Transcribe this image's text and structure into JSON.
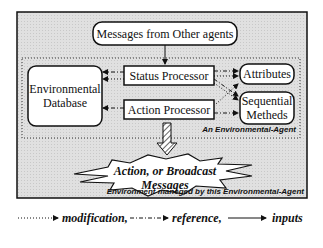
{
  "diagram": {
    "top_box": "Messages from Other agents",
    "agent_label": "An Environmental-Agent",
    "env_label": "Environment maneged by this Environmental-Agent",
    "db": [
      "Environmental",
      "Database"
    ],
    "status_processor": "Status Processor",
    "action_processor": "Action Processor",
    "attributes": "Attributes",
    "seq": [
      "Sequential",
      "Metheds"
    ],
    "burst": [
      "Action, or Broadcast",
      "Messages"
    ]
  },
  "legend": {
    "modification": "modification,",
    "reference": "reference,",
    "inputs": "inputs"
  },
  "colors": {
    "background": "#dcdcdc",
    "box": "#ffffff",
    "stroke": "#111111"
  }
}
